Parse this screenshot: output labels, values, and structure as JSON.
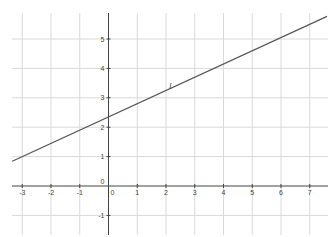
{
  "chart_data": {
    "type": "line",
    "title": "",
    "xlabel": "",
    "ylabel": "",
    "xlim": [
      -3.35,
      7.6
    ],
    "ylim": [
      -1.7,
      5.9
    ],
    "grid": true,
    "legend": null,
    "x_ticks": [
      -3,
      -2,
      -1,
      0,
      1,
      2,
      3,
      4,
      5,
      6,
      7
    ],
    "y_ticks": [
      -1,
      0,
      1,
      2,
      3,
      4,
      5
    ],
    "x_tick_labels": [
      "-3",
      "-2",
      "-1",
      "0",
      "1",
      "2",
      "3",
      "4",
      "5",
      "6",
      "7"
    ],
    "y_tick_labels": [
      "-1",
      "0",
      "1",
      "2",
      "3",
      "4",
      "5"
    ],
    "series": [
      {
        "name": "l",
        "equation": "y = 0.45x + 2.35",
        "slope": 0.45,
        "intercept": 2.35,
        "x": [
          -3.35,
          7.6
        ],
        "y": [
          0.84,
          5.77
        ],
        "color": "#555555"
      }
    ],
    "annotations": [
      {
        "text": "l",
        "x": 2.1,
        "y": 3.3
      }
    ]
  },
  "colors": {
    "grid": "#d9d9d9",
    "axis": "#444444",
    "line": "#555555",
    "background": "#ffffff"
  }
}
